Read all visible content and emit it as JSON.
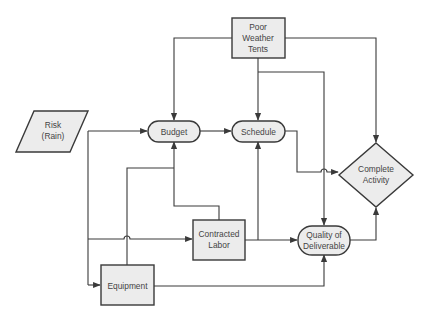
{
  "diagram": {
    "type": "flowchart",
    "nodes": {
      "risk": {
        "shape": "parallelogram",
        "lines": [
          "Risk",
          "(Rain)"
        ]
      },
      "tents": {
        "shape": "rectangle",
        "lines": [
          "Poor",
          "Weather",
          "Tents"
        ]
      },
      "budget": {
        "shape": "pill",
        "lines": [
          "Budget"
        ]
      },
      "schedule": {
        "shape": "pill",
        "lines": [
          "Schedule"
        ]
      },
      "complete": {
        "shape": "diamond",
        "lines": [
          "Complete",
          "Activity"
        ]
      },
      "labor": {
        "shape": "rectangle",
        "lines": [
          "Contracted",
          "Labor"
        ]
      },
      "quality": {
        "shape": "pill",
        "lines": [
          "Quality of",
          "Deliverable"
        ]
      },
      "equipment": {
        "shape": "rectangle",
        "lines": [
          "Equipment"
        ]
      }
    },
    "edges": [
      {
        "from": "Risk (Rain)",
        "to": "Budget"
      },
      {
        "from": "Risk (Rain)",
        "to": "Contracted Labor"
      },
      {
        "from": "Risk (Rain)",
        "to": "Equipment"
      },
      {
        "from": "Poor Weather Tents",
        "to": "Budget"
      },
      {
        "from": "Poor Weather Tents",
        "to": "Schedule"
      },
      {
        "from": "Poor Weather Tents",
        "to": "Complete Activity"
      },
      {
        "from": "Poor Weather Tents",
        "to": "Quality of Deliverable"
      },
      {
        "from": "Budget",
        "to": "Schedule"
      },
      {
        "from": "Schedule",
        "to": "Complete Activity"
      },
      {
        "from": "Contracted Labor",
        "to": "Budget"
      },
      {
        "from": "Contracted Labor",
        "to": "Schedule"
      },
      {
        "from": "Contracted Labor",
        "to": "Quality of Deliverable"
      },
      {
        "from": "Equipment",
        "to": "Budget"
      },
      {
        "from": "Equipment",
        "to": "Quality of Deliverable"
      },
      {
        "from": "Quality of Deliverable",
        "to": "Complete Activity"
      }
    ],
    "colors": {
      "node_fill": "#ececec",
      "stroke": "#3a3a3a",
      "text": "#444444",
      "background": "#ffffff"
    }
  }
}
